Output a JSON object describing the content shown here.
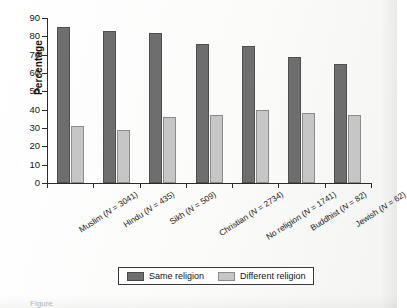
{
  "chart_data": {
    "type": "bar",
    "title": "",
    "xlabel": "",
    "ylabel": "Percentage",
    "ylim": [
      0,
      90
    ],
    "ytick_step": 10,
    "yticks": [
      0,
      10,
      20,
      30,
      40,
      50,
      60,
      70,
      80,
      90
    ],
    "grid": false,
    "legend_position": "bottom",
    "categories": [
      "Muslim (N = 3041)",
      "Hindu (N = 435)",
      "Sikh (N = 509)",
      "Christian (N = 2734)",
      "No religion (N = 1741)",
      "Buddhist (N = 82)",
      "Jewish (N = 62)"
    ],
    "series": [
      {
        "name": "Same religion",
        "color": "#6e6e6e",
        "values": [
          85,
          83,
          82,
          76,
          75,
          69,
          65
        ]
      },
      {
        "name": "Different religion",
        "color": "#c6c6c6",
        "values": [
          31,
          29,
          36,
          37,
          40,
          38,
          37
        ]
      }
    ]
  },
  "axis": {
    "y_label": "Percentage"
  },
  "legend": {
    "items": [
      {
        "label": "Same religion",
        "swatch": "same"
      },
      {
        "label": "Different religion",
        "swatch": "diff"
      }
    ]
  },
  "caption": {
    "text": "Figure"
  }
}
